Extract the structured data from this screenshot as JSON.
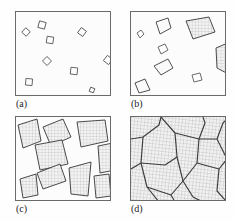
{
  "figure": {
    "background_color": "#fefefe",
    "panel_border_color": "#6a6a6a",
    "outline_color": "#4a4a4a",
    "hatch_color": "#b9b9b9",
    "fill_color": "#f2f2f2",
    "panel_width": 96,
    "panel_height": 85
  },
  "panels": [
    {
      "id": "a",
      "caption": "(a)",
      "stage": "nucleation",
      "description": "Small nuclei of randomly oriented crystals dispersed in the liquid",
      "x": 15,
      "y": 11,
      "crystal_count": 9,
      "crystals": [
        {
          "cx": 10,
          "cy": 20,
          "r": 3.0,
          "rot": 42
        },
        {
          "cx": 26,
          "cy": 13,
          "r": 3.4,
          "rot": 15
        },
        {
          "cx": 34,
          "cy": 28,
          "r": 3.3,
          "rot": 8
        },
        {
          "cx": 66,
          "cy": 20,
          "r": 3.2,
          "rot": 36
        },
        {
          "cx": 31,
          "cy": 49,
          "r": 3.2,
          "rot": 44
        },
        {
          "cx": 58,
          "cy": 59,
          "r": 3.4,
          "rot": 6
        },
        {
          "cx": 92,
          "cy": 48,
          "r": 3.3,
          "rot": 38
        },
        {
          "cx": 13,
          "cy": 70,
          "r": 3.3,
          "rot": 5
        },
        {
          "cx": 76,
          "cy": 78,
          "r": 2.2,
          "rot": 20
        }
      ]
    },
    {
      "id": "b",
      "caption": "(b)",
      "stage": "early growth",
      "description": "Growth of the crystallites; obstruction of some grains that are adjacent to one another is also shown",
      "x": 130,
      "y": 11,
      "grain_count": 8,
      "grains": [
        {
          "points": "7,22 11,19 14,23 10,27",
          "hatched": false
        },
        {
          "points": "26,10 38,7 41,17 30,22",
          "hatched": false
        },
        {
          "points": "57,9 79,6 85,21 64,27",
          "hatched": true
        },
        {
          "points": "28,36 35,33 38,39 31,43",
          "hatched": false
        },
        {
          "points": "24,54 38,48 43,57 31,63",
          "hatched": false
        },
        {
          "points": "62,64 70,62 72,69 64,71",
          "hatched": false
        },
        {
          "points": "86,38 96,33 99,62 87,57",
          "hatched": true
        },
        {
          "points": "5,72 15,68 20,79 9,82",
          "hatched": false
        }
      ]
    },
    {
      "id": "c",
      "caption": "(c)",
      "stage": "late growth",
      "description": "Completion of solidification; grains having irregular shapes have formed",
      "x": 15,
      "y": 116,
      "grain_count": 9,
      "grains": [
        {
          "points": "3,8 22,3 26,24 8,31",
          "hatched": true
        },
        {
          "points": "28,10 48,3 56,20 36,29",
          "hatched": true
        },
        {
          "points": "62,6 90,4 93,24 66,30",
          "hatched": true
        },
        {
          "points": "20,28 47,24 53,47 25,53",
          "hatched": true
        },
        {
          "points": "83,30 96,27 99,52 85,56",
          "hatched": true
        },
        {
          "points": "22,56 44,48 50,64 28,72",
          "hatched": true
        },
        {
          "points": "5,62 20,58 22,78 8,80",
          "hatched": true
        },
        {
          "points": "54,52 75,46 72,78 56,77",
          "hatched": true
        },
        {
          "points": "78,60 92,58 94,78 80,80",
          "hatched": true
        }
      ]
    },
    {
      "id": "d",
      "caption": "(d)",
      "stage": "grain structure",
      "description": "The grain structure as it would appear under the microscope; dark lines are the grain boundaries",
      "x": 130,
      "y": 116,
      "grain_count": 10,
      "boundaries": [
        "0,22 12,20 28,8 30,0",
        "12,20 10,46 0,52",
        "10,46 34,48 46,40",
        "46,40 44,16 30,0",
        "46,40 52,64 40,78",
        "10,46 16,70 28,85",
        "16,70 40,78",
        "44,16 68,22 74,6 72,0",
        "68,22 66,46 52,64",
        "66,46 88,52 96,42",
        "88,52 86,74 96,85",
        "52,64 62,80 72,85",
        "96,42 86,22 68,22",
        "86,22 92,6 96,2"
      ]
    }
  ]
}
